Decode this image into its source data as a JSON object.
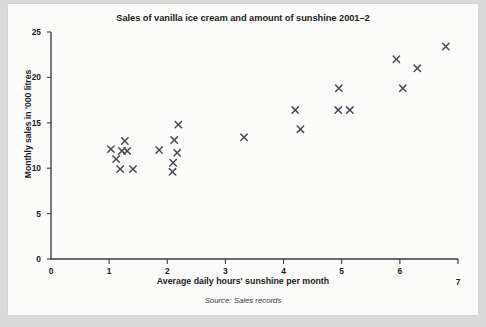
{
  "chart_data": {
    "type": "scatter",
    "title": "Sales of vanilla ice cream and amount of sunshine 2001–2",
    "xlabel": "Average daily hours' sunshine per month",
    "ylabel": "Monthly sales in '000 litres",
    "source": "Source: Sales records",
    "xlim": [
      0,
      7
    ],
    "ylim": [
      0,
      25
    ],
    "xticks": [
      0,
      1,
      2,
      3,
      4,
      5,
      6,
      7
    ],
    "xtick_labels": [
      "0",
      "1",
      "2",
      "3",
      "4",
      "5",
      "6",
      "7"
    ],
    "yticks": [
      0,
      5,
      10,
      15,
      20,
      25
    ],
    "ytick_labels": [
      "0",
      "5",
      "10",
      "15",
      "20",
      "25"
    ],
    "grid": false,
    "legend": null,
    "marker": "x",
    "marker_color": "#4b4b55",
    "points": [
      {
        "x": 1.03,
        "y": 12.1
      },
      {
        "x": 1.27,
        "y": 13.0
      },
      {
        "x": 1.12,
        "y": 11.0
      },
      {
        "x": 1.22,
        "y": 11.9
      },
      {
        "x": 1.31,
        "y": 11.9
      },
      {
        "x": 1.19,
        "y": 9.9
      },
      {
        "x": 1.41,
        "y": 9.9
      },
      {
        "x": 2.19,
        "y": 14.8
      },
      {
        "x": 2.12,
        "y": 13.1
      },
      {
        "x": 1.86,
        "y": 12.0
      },
      {
        "x": 2.17,
        "y": 11.7
      },
      {
        "x": 2.1,
        "y": 10.6
      },
      {
        "x": 2.09,
        "y": 9.6
      },
      {
        "x": 3.32,
        "y": 13.4
      },
      {
        "x": 4.2,
        "y": 16.4
      },
      {
        "x": 4.29,
        "y": 14.3
      },
      {
        "x": 4.95,
        "y": 18.8
      },
      {
        "x": 4.94,
        "y": 16.4
      },
      {
        "x": 5.14,
        "y": 16.4
      },
      {
        "x": 5.94,
        "y": 22.0
      },
      {
        "x": 6.05,
        "y": 18.8
      },
      {
        "x": 6.3,
        "y": 21.0
      },
      {
        "x": 6.79,
        "y": 23.4
      }
    ]
  }
}
